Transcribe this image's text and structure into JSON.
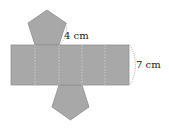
{
  "figure": {
    "type": "net",
    "solid": "pentagonal prism",
    "colors": {
      "face_fill": "#a8a8a8",
      "face_stroke": "#8f8f8f",
      "fold_line": "#d8d8d8",
      "label": "#222222"
    },
    "rectangle_panels": 5,
    "pentagon_faces": 2
  },
  "labels": {
    "edge_length": "4 cm",
    "height": "7 cm"
  }
}
